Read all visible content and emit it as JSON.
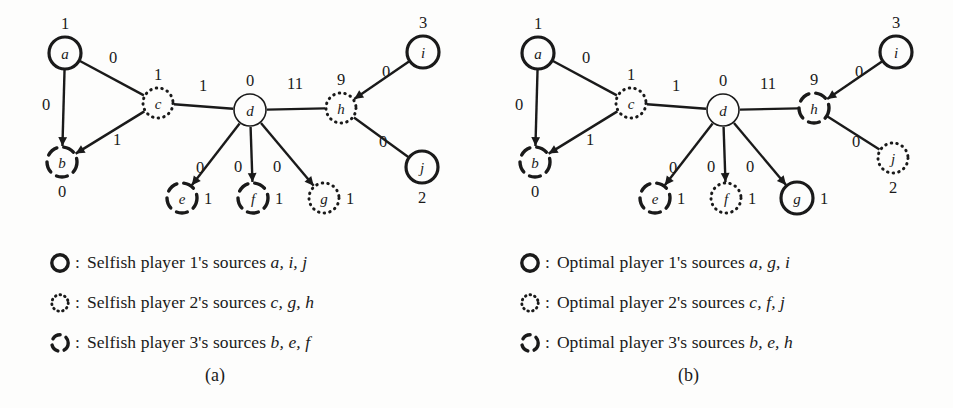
{
  "figure": {
    "background": "#fdfdfc",
    "ink": "#1a1a1a"
  },
  "panels": [
    {
      "id": "a",
      "caption": "(a)",
      "origin_x": 0,
      "nodes": [
        {
          "id": "a",
          "label": "a",
          "x": 65,
          "y": 53,
          "r": 16,
          "style": "solid-bold",
          "weight": "1",
          "weight_pos": "top"
        },
        {
          "id": "b",
          "label": "b",
          "x": 62,
          "y": 162,
          "r": 15,
          "style": "dashed",
          "weight": "0",
          "weight_pos": "bottom"
        },
        {
          "id": "c",
          "label": "c",
          "x": 158,
          "y": 103,
          "r": 15,
          "style": "dotted",
          "weight": "1",
          "weight_pos": "top"
        },
        {
          "id": "d",
          "label": "d",
          "x": 250,
          "y": 110,
          "r": 16,
          "style": "solid-thin",
          "weight": "0",
          "weight_pos": "top"
        },
        {
          "id": "e",
          "label": "e",
          "x": 182,
          "y": 198,
          "r": 15,
          "style": "dashed",
          "weight": "1",
          "weight_pos": "right"
        },
        {
          "id": "f",
          "label": "f",
          "x": 253,
          "y": 198,
          "r": 15,
          "style": "dashed",
          "weight": "1",
          "weight_pos": "right"
        },
        {
          "id": "g",
          "label": "g",
          "x": 324,
          "y": 198,
          "r": 15,
          "style": "dotted",
          "weight": "1",
          "weight_pos": "right"
        },
        {
          "id": "h",
          "label": "h",
          "x": 341,
          "y": 108,
          "r": 15,
          "style": "dotted",
          "weight": "9",
          "weight_pos": "top"
        },
        {
          "id": "i",
          "label": "i",
          "x": 423,
          "y": 52,
          "r": 16,
          "style": "solid-bold",
          "weight": "3",
          "weight_pos": "top"
        },
        {
          "id": "j",
          "label": "j",
          "x": 422,
          "y": 167,
          "r": 16,
          "style": "solid-bold",
          "weight": "2",
          "weight_pos": "bottom"
        }
      ],
      "edges": [
        {
          "from": "a",
          "to": "b",
          "label": "0",
          "lx": 46,
          "ly": 110,
          "arrow": true
        },
        {
          "from": "a",
          "to": "c",
          "label": "0",
          "lx": 113,
          "ly": 63,
          "arrow": false
        },
        {
          "from": "c",
          "to": "b",
          "label": "1",
          "lx": 117,
          "ly": 145,
          "arrow": true
        },
        {
          "from": "c",
          "to": "d",
          "label": "1",
          "lx": 203,
          "ly": 91,
          "arrow": false
        },
        {
          "from": "d",
          "to": "e",
          "label": "0",
          "lx": 200,
          "ly": 173,
          "arrow": true
        },
        {
          "from": "d",
          "to": "f",
          "label": "0",
          "lx": 238,
          "ly": 172,
          "arrow": true
        },
        {
          "from": "d",
          "to": "g",
          "label": "0",
          "lx": 277,
          "ly": 172,
          "arrow": true
        },
        {
          "from": "d",
          "to": "h",
          "label": "11",
          "lx": 295,
          "ly": 89,
          "arrow": false
        },
        {
          "from": "i",
          "to": "h",
          "label": "0",
          "lx": 386,
          "ly": 77,
          "arrow": true
        },
        {
          "from": "j",
          "to": "h",
          "label": "0",
          "lx": 383,
          "ly": 147,
          "arrow": false
        }
      ],
      "legend": [
        {
          "marker": "solid-bold",
          "colon": ":",
          "text": "Selfish player 1's sources ",
          "sources": "a, i, j"
        },
        {
          "marker": "dotted",
          "colon": ":",
          "text": "Selfish player 2's sources ",
          "sources": "c, g, h"
        },
        {
          "marker": "dashed",
          "colon": ":",
          "text": "Selfish player 3's sources ",
          "sources": "b, e, f"
        }
      ]
    },
    {
      "id": "b",
      "caption": "(b)",
      "origin_x": 473,
      "nodes": [
        {
          "id": "a",
          "label": "a",
          "x": 65,
          "y": 53,
          "r": 16,
          "style": "solid-bold",
          "weight": "1",
          "weight_pos": "top"
        },
        {
          "id": "b",
          "label": "b",
          "x": 62,
          "y": 162,
          "r": 15,
          "style": "dashed",
          "weight": "0",
          "weight_pos": "bottom"
        },
        {
          "id": "c",
          "label": "c",
          "x": 158,
          "y": 103,
          "r": 15,
          "style": "dotted",
          "weight": "1",
          "weight_pos": "top"
        },
        {
          "id": "d",
          "label": "d",
          "x": 250,
          "y": 110,
          "r": 16,
          "style": "solid-thin",
          "weight": "0",
          "weight_pos": "top"
        },
        {
          "id": "e",
          "label": "e",
          "x": 182,
          "y": 198,
          "r": 15,
          "style": "dashed",
          "weight": "1",
          "weight_pos": "right"
        },
        {
          "id": "f",
          "label": "f",
          "x": 253,
          "y": 198,
          "r": 15,
          "style": "dotted",
          "weight": "1",
          "weight_pos": "right"
        },
        {
          "id": "g",
          "label": "g",
          "x": 324,
          "y": 198,
          "r": 16,
          "style": "solid-bold",
          "weight": "1",
          "weight_pos": "right"
        },
        {
          "id": "h",
          "label": "h",
          "x": 341,
          "y": 108,
          "r": 15,
          "style": "dashed",
          "weight": "9",
          "weight_pos": "top"
        },
        {
          "id": "i",
          "label": "i",
          "x": 423,
          "y": 52,
          "r": 16,
          "style": "solid-bold",
          "weight": "3",
          "weight_pos": "top"
        },
        {
          "id": "j",
          "label": "j",
          "x": 420,
          "y": 158,
          "r": 15,
          "style": "dotted",
          "weight": "2",
          "weight_pos": "bottom"
        }
      ],
      "edges": [
        {
          "from": "a",
          "to": "b",
          "label": "0",
          "lx": 46,
          "ly": 110,
          "arrow": true
        },
        {
          "from": "a",
          "to": "c",
          "label": "0",
          "lx": 113,
          "ly": 63,
          "arrow": false
        },
        {
          "from": "c",
          "to": "b",
          "label": "1",
          "lx": 117,
          "ly": 145,
          "arrow": true
        },
        {
          "from": "c",
          "to": "d",
          "label": "1",
          "lx": 203,
          "ly": 91,
          "arrow": false
        },
        {
          "from": "d",
          "to": "e",
          "label": "0",
          "lx": 200,
          "ly": 173,
          "arrow": true
        },
        {
          "from": "d",
          "to": "f",
          "label": "0",
          "lx": 238,
          "ly": 172,
          "arrow": true
        },
        {
          "from": "d",
          "to": "g",
          "label": "0",
          "lx": 277,
          "ly": 172,
          "arrow": true
        },
        {
          "from": "d",
          "to": "h",
          "label": "11",
          "lx": 295,
          "ly": 89,
          "arrow": false
        },
        {
          "from": "i",
          "to": "h",
          "label": "0",
          "lx": 386,
          "ly": 77,
          "arrow": true
        },
        {
          "from": "h",
          "to": "j",
          "label": "0",
          "lx": 383,
          "ly": 147,
          "arrow": false
        }
      ],
      "legend": [
        {
          "marker": "solid-bold",
          "colon": ":",
          "text": "Optimal player 1's sources ",
          "sources": "a, g, i"
        },
        {
          "marker": "dotted",
          "colon": ":",
          "text": "Optimal player 2's sources ",
          "sources": "c, f, j"
        },
        {
          "marker": "dashed",
          "colon": ":",
          "text": "Optimal player 3's sources ",
          "sources": "b, e, h"
        }
      ]
    }
  ],
  "legend_layout": {
    "left_x": 48,
    "right_x": 518,
    "top_y": 243,
    "row_height": 40
  },
  "caption_layout": {
    "left_x": 205,
    "right_x": 678,
    "y": 365
  }
}
